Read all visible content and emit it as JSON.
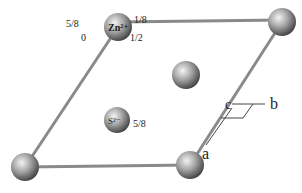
{
  "diagram": {
    "type": "crystal unit cell (ZnS, wurtzite projection)",
    "colors": {
      "edge": "#8a8a8a",
      "sphere_light": "#e8e8e8",
      "sphere_dark": "#4a4a4a",
      "text": "#222222"
    },
    "atoms": [
      {
        "id": "zn-top-left",
        "label": "Zn²⁺",
        "cx": 118,
        "cy": 27,
        "r": 14
      },
      {
        "id": "corner-top-right",
        "label": "",
        "cx": 282,
        "cy": 22,
        "r": 14
      },
      {
        "id": "center",
        "label": "",
        "cx": 186,
        "cy": 75,
        "r": 14
      },
      {
        "id": "s-ion",
        "label": "S²⁻",
        "cx": 117,
        "cy": 120,
        "r": 13
      },
      {
        "id": "corner-bottom-left",
        "label": "",
        "cx": 25,
        "cy": 167,
        "r": 14
      },
      {
        "id": "corner-bottom-right",
        "label": "",
        "cx": 190,
        "cy": 165,
        "r": 14
      }
    ],
    "height_labels": {
      "zn_upper_left": "5/8",
      "zn_upper_right": "1/8",
      "zn_lower_left": "0",
      "zn_lower_right": "1/2",
      "s_label": "5/8"
    },
    "axes": {
      "a": "a",
      "b": "b",
      "c": "c"
    }
  }
}
